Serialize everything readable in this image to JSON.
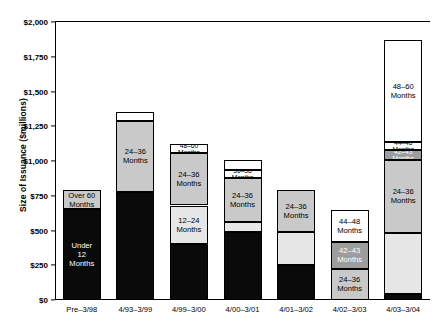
{
  "chart_data": {
    "type": "bar",
    "subtype": "stacked-bar",
    "title": "",
    "xlabel": "",
    "ylabel": "Size of Issuance ($millions)",
    "ylim": [
      0,
      2000
    ],
    "ytick_labels": [
      "$2,000",
      "$1,750",
      "$1,500",
      "$1,250",
      "$1,000",
      "$750",
      "$500",
      "$250",
      "$0"
    ],
    "ytick_values": [
      2000,
      1750,
      1500,
      1250,
      1000,
      750,
      500,
      250,
      0
    ],
    "grid": false,
    "legend": "none (segments labeled in place)",
    "categories": [
      "Pre–3/98",
      "4/93–3/99",
      "4/99–3/00",
      "4/00–3/01",
      "4/01–3/02",
      "4/02–3/03",
      "4/03–3/04"
    ],
    "bars": [
      {
        "category": "Pre–3/98",
        "total": 790,
        "segments": [
          {
            "label": "Under\n12\nMonths",
            "value": 655,
            "start": 0,
            "end": 655,
            "fill": "black"
          },
          {
            "label": "Over 60\nMonths",
            "value": 135,
            "start": 655,
            "end": 790,
            "fill": "gray"
          }
        ]
      },
      {
        "category": "4/93–3/99",
        "total": 1350,
        "segments": [
          {
            "label": "",
            "value": 775,
            "start": 0,
            "end": 775,
            "fill": "black"
          },
          {
            "label": "24–36\nMonths",
            "value": 515,
            "start": 775,
            "end": 1290,
            "fill": "gray"
          },
          {
            "label": "",
            "value": 60,
            "start": 1290,
            "end": 1350,
            "fill": "white"
          }
        ]
      },
      {
        "category": "4/99–3/00",
        "total": 1120,
        "segments": [
          {
            "label": "",
            "value": 400,
            "start": 0,
            "end": 400,
            "fill": "black"
          },
          {
            "label": "12–24\nMonths",
            "value": 280,
            "start": 400,
            "end": 680,
            "fill": "lgray"
          },
          {
            "label": "24–36\nMonths",
            "value": 375,
            "start": 680,
            "end": 1055,
            "fill": "gray"
          },
          {
            "label": "48–60 Months",
            "value": 65,
            "start": 1055,
            "end": 1120,
            "fill": "white"
          }
        ]
      },
      {
        "category": "4/00–3/01",
        "total": 1010,
        "segments": [
          {
            "label": "",
            "value": 490,
            "start": 0,
            "end": 490,
            "fill": "black"
          },
          {
            "label": "",
            "value": 70,
            "start": 490,
            "end": 560,
            "fill": "lgray"
          },
          {
            "label": "24–36\nMonths",
            "value": 320,
            "start": 560,
            "end": 880,
            "fill": "gray"
          },
          {
            "label": "36–38 Months",
            "value": 55,
            "start": 880,
            "end": 935,
            "fill": "white"
          },
          {
            "label": "",
            "value": 75,
            "start": 935,
            "end": 1010,
            "fill": "white"
          }
        ]
      },
      {
        "category": "4/01–3/02",
        "total": 790,
        "segments": [
          {
            "label": "",
            "value": 255,
            "start": 0,
            "end": 255,
            "fill": "black"
          },
          {
            "label": "",
            "value": 235,
            "start": 255,
            "end": 490,
            "fill": "lgray"
          },
          {
            "label": "24–36\nMonths",
            "value": 300,
            "start": 490,
            "end": 790,
            "fill": "gray"
          }
        ]
      },
      {
        "category": "4/02–3/03",
        "total": 650,
        "segments": [
          {
            "label": "24–36\nMonths",
            "value": 225,
            "start": 0,
            "end": 225,
            "fill": "gray"
          },
          {
            "label": "42–43\nMonths",
            "value": 195,
            "start": 225,
            "end": 420,
            "fill": "dgray"
          },
          {
            "label": "44–48\nMonths",
            "value": 230,
            "start": 420,
            "end": 650,
            "fill": "white"
          }
        ]
      },
      {
        "category": "4/03–3/04",
        "total": 1870,
        "segments": [
          {
            "label": "",
            "value": 40,
            "start": 0,
            "end": 40,
            "fill": "black"
          },
          {
            "label": "",
            "value": 440,
            "start": 40,
            "end": 480,
            "fill": "lgray"
          },
          {
            "label": "24–36\nMonths",
            "value": 530,
            "start": 480,
            "end": 1010,
            "fill": "gray"
          },
          {
            "label": "42–43 Months",
            "value": 70,
            "start": 1010,
            "end": 1080,
            "fill": "dgray"
          },
          {
            "label": "44–48 Months",
            "value": 60,
            "start": 1080,
            "end": 1140,
            "fill": "white"
          },
          {
            "label": "48–60\nMonths",
            "value": 730,
            "start": 1140,
            "end": 1870,
            "fill": "white"
          }
        ]
      }
    ],
    "colors": {
      "black": "#0a0a0a",
      "dgray": "#9d9d9d",
      "gray": "#c9c9c9",
      "lgray": "#e6e6e6",
      "white": "#ffffff",
      "axis": "#000000"
    }
  }
}
